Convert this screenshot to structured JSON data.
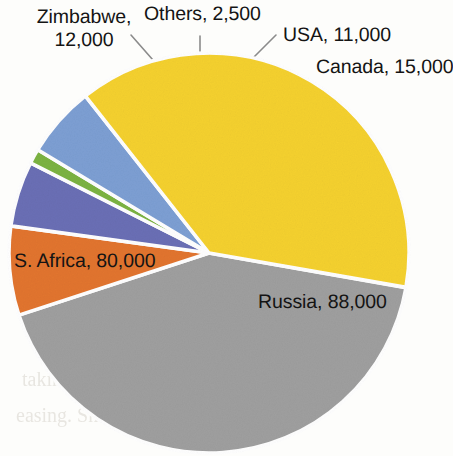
{
  "chart_data": {
    "type": "pie",
    "title": "",
    "subtitle": "",
    "xlabel": "",
    "ylabel": "",
    "legend_position": "none",
    "grid": false,
    "labels_show_value": true,
    "total": 208500,
    "categories": [
      "Russia",
      "Canada",
      "USA",
      "Others",
      "Zimbabwe",
      "S. Africa"
    ],
    "values": [
      88000,
      15000,
      11000,
      2500,
      12000,
      80000
    ],
    "colors": [
      "#9f9f9f",
      "#e2752f",
      "#6a6fb5",
      "#7cb342",
      "#7d9fd3",
      "#f5d130"
    ],
    "slices": [
      {
        "name": "Russia",
        "label": "Russia, 88,000",
        "value": 88000,
        "color": "#9f9f9f",
        "start_angle": 0,
        "sweep_angle": 151.9,
        "percent": 42.2
      },
      {
        "name": "Canada",
        "label": "Canada, 15,000",
        "value": 15000,
        "color": "#e2752f",
        "start_angle": 151.9,
        "sweep_angle": 25.9,
        "percent": 7.2
      },
      {
        "name": "USA",
        "label": "USA, 11,000",
        "value": 11000,
        "color": "#6a6fb5",
        "start_angle": 177.8,
        "sweep_angle": 19.0,
        "percent": 5.3
      },
      {
        "name": "Others",
        "label": "Others, 2,500",
        "value": 2500,
        "color": "#7cb342",
        "start_angle": 196.8,
        "sweep_angle": 4.3,
        "percent": 1.2
      },
      {
        "name": "Zimbabwe",
        "label": "Zimbabwe, 12,000",
        "value": 12000,
        "color": "#7d9fd3",
        "start_angle": 201.1,
        "sweep_angle": 20.7,
        "percent": 5.8
      },
      {
        "name": "S. Africa",
        "label": "S. Africa, 80,000",
        "value": 80000,
        "color": "#f5d130",
        "start_angle": 221.8,
        "sweep_angle": 138.1,
        "percent": 38.4
      }
    ]
  },
  "labels": {
    "zimbabwe_line1": "Zimbabwe,",
    "zimbabwe_line2": "12,000",
    "others": "Others, 2,500",
    "usa": "USA, 11,000",
    "canada": "Canada, 15,000",
    "safrica": "S. Africa, 80,000",
    "russia": "Russia, 88,000"
  },
  "background": {
    "page_color": "#fdfdfb",
    "bleed_text": [
      "some  problem",
      "other angles",
      "s a  an",
      "taking it in",
      "easing. Sharp"
    ]
  }
}
